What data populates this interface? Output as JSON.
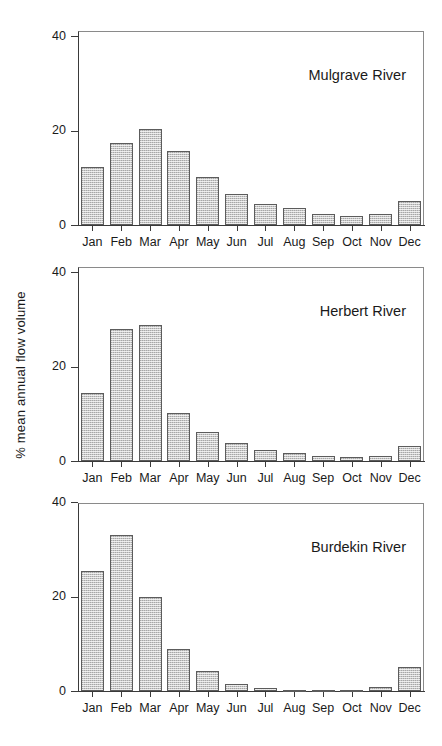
{
  "figure": {
    "ylabel": "% mean annual flow volume",
    "yticks": [
      "0",
      "20",
      "40"
    ]
  },
  "chart_data": [
    {
      "type": "bar",
      "title": "Mulgrave River",
      "categories": [
        "Jan",
        "Feb",
        "Mar",
        "Apr",
        "May",
        "Jun",
        "Jul",
        "Aug",
        "Sep",
        "Oct",
        "Nov",
        "Dec"
      ],
      "values": [
        12.3,
        17.4,
        20.4,
        15.6,
        10.2,
        6.5,
        4.4,
        3.5,
        2.4,
        1.9,
        2.4,
        5.0
      ],
      "xlabel": "",
      "ylabel": "% mean annual flow volume",
      "ylim": [
        0,
        40
      ],
      "yticks": [
        0,
        20,
        40
      ],
      "grid": false,
      "legend": "none"
    },
    {
      "type": "bar",
      "title": "Herbert River",
      "categories": [
        "Jan",
        "Feb",
        "Mar",
        "Apr",
        "May",
        "Jun",
        "Jul",
        "Aug",
        "Sep",
        "Oct",
        "Nov",
        "Dec"
      ],
      "values": [
        14.4,
        28.0,
        28.8,
        10.2,
        6.2,
        3.9,
        2.4,
        1.6,
        1.1,
        0.9,
        1.0,
        3.2
      ],
      "xlabel": "",
      "ylabel": "% mean annual flow volume",
      "ylim": [
        0,
        40
      ],
      "yticks": [
        0,
        20,
        40
      ],
      "grid": false,
      "legend": "none"
    },
    {
      "type": "bar",
      "title": "Burdekin River",
      "categories": [
        "Jan",
        "Feb",
        "Mar",
        "Apr",
        "May",
        "Jun",
        "Jul",
        "Aug",
        "Sep",
        "Oct",
        "Nov",
        "Dec"
      ],
      "values": [
        25.4,
        33.0,
        19.9,
        8.8,
        4.3,
        1.5,
        0.6,
        0.2,
        0.1,
        0.1,
        0.9,
        5.1
      ],
      "xlabel": "",
      "ylabel": "% mean annual flow volume",
      "ylim": [
        0,
        40
      ],
      "yticks": [
        0,
        20,
        40
      ],
      "grid": false,
      "legend": "none"
    }
  ]
}
